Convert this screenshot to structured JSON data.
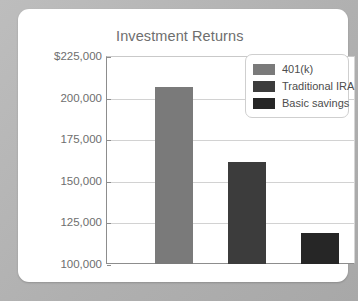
{
  "card": {
    "background_color": "#ffffff",
    "outer_background_color": "#b3b3b3"
  },
  "chart_data": {
    "type": "bar",
    "title": "Investment Returns",
    "xlabel": "",
    "ylabel": "",
    "categories": [
      "401(k)",
      "Traditional IRA",
      "Basic savings"
    ],
    "values": [
      207000,
      162000,
      119000
    ],
    "ylim": [
      100000,
      225000
    ],
    "ytick_values": [
      225000,
      200000,
      175000,
      150000,
      125000,
      100000
    ],
    "ytick_labels": [
      "$225,000",
      "200,000",
      "175,000",
      "150,000",
      "125,000",
      "100,000"
    ],
    "grid": true,
    "legend_position": "top-right",
    "series_colors": [
      "#7a7a7a",
      "#3c3c3c",
      "#262626"
    ],
    "legend": [
      {
        "label": "401(k)",
        "color": "#7a7a7a"
      },
      {
        "label": "Traditional IRA",
        "color": "#3c3c3c"
      },
      {
        "label": "Basic savings",
        "color": "#262626"
      }
    ]
  }
}
